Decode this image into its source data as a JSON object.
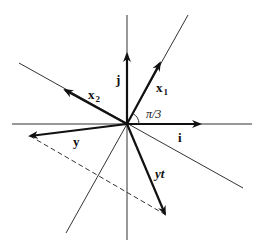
{
  "diagram": {
    "labels": {
      "i": "i",
      "j": "j",
      "x1_main": "x",
      "x1_sub": "1",
      "x2_main": "x",
      "x2_sub": "2",
      "y": "y",
      "yt": "yt",
      "angle": "π/3"
    },
    "colors": {
      "ink": "#111111",
      "background": "#ffffff"
    }
  }
}
